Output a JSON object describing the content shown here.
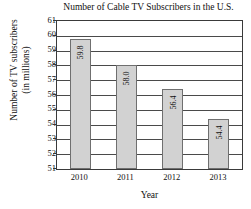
{
  "chart_data": {
    "type": "bar",
    "title": "Number of Cable TV Subscribers in the U.S.",
    "xlabel": "Year",
    "ylabel_line1": "Number of TV subscribers",
    "ylabel_line2": "(in millions)",
    "categories": [
      "2010",
      "2011",
      "2012",
      "2013"
    ],
    "values": [
      59.8,
      58.0,
      56.4,
      54.4
    ],
    "value_labels": [
      "59.8",
      "58.0",
      "56.4",
      "54.4"
    ],
    "ylim": [
      51,
      61
    ],
    "ytick_labels": [
      "61",
      "60",
      "59",
      "58",
      "57",
      "56",
      "55",
      "54",
      "53",
      "52",
      "51"
    ],
    "ytick_values": [
      61,
      60,
      59,
      58,
      57,
      56,
      55,
      54,
      53,
      52,
      51
    ],
    "grid": true,
    "legend": false,
    "bar_color": "#d2d2d2",
    "bar_border_color": "#6f6f6f",
    "axis_color": "#3a3a3a",
    "text_color": "#111111"
  }
}
